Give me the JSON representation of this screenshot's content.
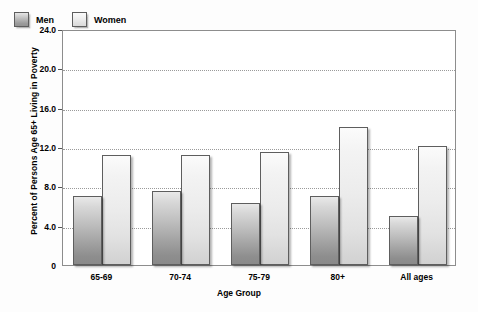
{
  "chart_data": {
    "type": "bar",
    "title": "",
    "xlabel": "Age Group",
    "ylabel": "Percent of Persons Age 65+ Living in Poverty",
    "categories": [
      "65-69",
      "70-74",
      "75-79",
      "80+",
      "All ages"
    ],
    "series": [
      {
        "name": "Men",
        "values": [
          7.0,
          7.5,
          6.3,
          7.0,
          5.0
        ],
        "color": "#a9a9a9"
      },
      {
        "name": "Women",
        "values": [
          11.2,
          11.2,
          11.5,
          14.0,
          12.1
        ],
        "color": "#e8e8e8"
      }
    ],
    "ylim": [
      0,
      24
    ],
    "yticks": [
      "0",
      "4.0",
      "8.0",
      "12.0",
      "16.0",
      "20.0",
      "24.0"
    ],
    "ytick_values": [
      0,
      4,
      8,
      12,
      16,
      20,
      24
    ],
    "grid": true,
    "grid_style": "dotted",
    "legend_position": "top-left-inside",
    "background": "#ffffff",
    "frame_color": "#8d8d8d"
  },
  "legend": {
    "items": [
      {
        "label": "Men"
      },
      {
        "label": "Women"
      }
    ]
  },
  "axes": {
    "y_title": "Percent of Persons Age 65+ Living in Poverty",
    "x_title": "Age Group"
  }
}
